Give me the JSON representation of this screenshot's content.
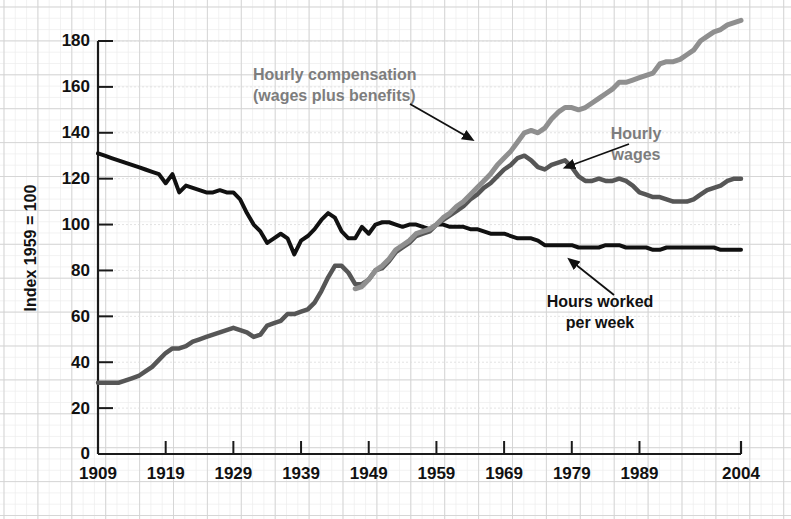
{
  "chart_data": {
    "type": "line",
    "title": "",
    "subtitle": "",
    "xlabel": "",
    "ylabel": "Index 1959 = 100",
    "xlim": [
      1909,
      2004
    ],
    "ylim": [
      0,
      190
    ],
    "grid": true,
    "grid_style": "graph-paper",
    "legend_position": "inline-annotations",
    "yticks": [
      0,
      20,
      40,
      60,
      80,
      100,
      120,
      140,
      160,
      180
    ],
    "ytick_labels": [
      "0",
      "20",
      "40",
      "60",
      "80",
      "100",
      "120",
      "140",
      "160",
      "180"
    ],
    "xticks": [
      1909,
      1919,
      1929,
      1939,
      1949,
      1959,
      1969,
      1979,
      1989,
      2004
    ],
    "xtick_labels": [
      "1909",
      "1919",
      "1929",
      "1939",
      "1949",
      "1959",
      "1969",
      "1979",
      "1989",
      "2004"
    ],
    "series": [
      {
        "name": "Hours worked per week",
        "color": "#111111",
        "width": 4.0,
        "x": [
          1909,
          1910,
          1911,
          1912,
          1913,
          1914,
          1915,
          1916,
          1917,
          1918,
          1919,
          1920,
          1921,
          1922,
          1923,
          1924,
          1925,
          1926,
          1927,
          1928,
          1929,
          1930,
          1931,
          1932,
          1933,
          1934,
          1935,
          1936,
          1937,
          1938,
          1939,
          1940,
          1941,
          1942,
          1943,
          1944,
          1945,
          1946,
          1947,
          1948,
          1949,
          1950,
          1951,
          1952,
          1953,
          1954,
          1955,
          1956,
          1957,
          1958,
          1959,
          1960,
          1961,
          1962,
          1963,
          1964,
          1965,
          1966,
          1967,
          1968,
          1969,
          1970,
          1971,
          1972,
          1973,
          1974,
          1975,
          1976,
          1977,
          1978,
          1979,
          1980,
          1981,
          1982,
          1983,
          1984,
          1985,
          1986,
          1987,
          1988,
          1989,
          1990,
          1991,
          1992,
          1993,
          1994,
          1995,
          1996,
          1997,
          1998,
          1999,
          2000,
          2001,
          2002,
          2003,
          2004
        ],
        "values": [
          131,
          130,
          129,
          128,
          127,
          126,
          125,
          124,
          123,
          122,
          118,
          122,
          114,
          117,
          116,
          115,
          114,
          114,
          115,
          114,
          114,
          111,
          105,
          100,
          97,
          92,
          94,
          96,
          94,
          87,
          93,
          95,
          98,
          102,
          105,
          103,
          97,
          94,
          94,
          99,
          96,
          100,
          101,
          101,
          100,
          99,
          100,
          100,
          99,
          98,
          100,
          100,
          99,
          99,
          99,
          98,
          98,
          97,
          96,
          96,
          96,
          95,
          94,
          94,
          94,
          93,
          91,
          91,
          91,
          91,
          91,
          90,
          90,
          90,
          90,
          91,
          91,
          91,
          90,
          90,
          90,
          90,
          89,
          89,
          90,
          90,
          90,
          90,
          90,
          90,
          90,
          90,
          89,
          89,
          89,
          89
        ]
      },
      {
        "name": "Hourly wages",
        "color": "#565656",
        "width": 4.5,
        "x": [
          1909,
          1910,
          1911,
          1912,
          1913,
          1914,
          1915,
          1916,
          1917,
          1918,
          1919,
          1920,
          1921,
          1922,
          1923,
          1924,
          1925,
          1926,
          1927,
          1928,
          1929,
          1930,
          1931,
          1932,
          1933,
          1934,
          1935,
          1936,
          1937,
          1938,
          1939,
          1940,
          1941,
          1942,
          1943,
          1944,
          1945,
          1946,
          1947,
          1948,
          1949,
          1950,
          1951,
          1952,
          1953,
          1954,
          1955,
          1956,
          1957,
          1958,
          1959,
          1960,
          1961,
          1962,
          1963,
          1964,
          1965,
          1966,
          1967,
          1968,
          1969,
          1970,
          1971,
          1972,
          1973,
          1974,
          1975,
          1976,
          1977,
          1978,
          1979,
          1980,
          1981,
          1982,
          1983,
          1984,
          1985,
          1986,
          1987,
          1988,
          1989,
          1990,
          1991,
          1992,
          1993,
          1994,
          1995,
          1996,
          1997,
          1998,
          1999,
          2000,
          2001,
          2002,
          2003,
          2004
        ],
        "values": [
          31,
          31,
          31,
          31,
          32,
          33,
          34,
          36,
          38,
          41,
          44,
          46,
          46,
          47,
          49,
          50,
          51,
          52,
          53,
          54,
          55,
          54,
          53,
          51,
          52,
          56,
          57,
          58,
          61,
          61,
          62,
          63,
          66,
          71,
          77,
          82,
          82,
          79,
          74,
          74,
          76,
          80,
          81,
          84,
          88,
          90,
          92,
          95,
          96,
          97,
          100,
          102,
          104,
          106,
          108,
          111,
          113,
          116,
          118,
          121,
          124,
          126,
          129,
          130,
          128,
          125,
          124,
          126,
          127,
          128,
          125,
          121,
          119,
          119,
          120,
          119,
          119,
          120,
          119,
          117,
          114,
          113,
          112,
          112,
          111,
          110,
          110,
          110,
          111,
          113,
          115,
          116,
          117,
          119,
          120,
          120
        ]
      },
      {
        "name": "Hourly compensation (wages plus benefits)",
        "color": "#8f8f8f",
        "width": 5.0,
        "x": [
          1947,
          1948,
          1949,
          1950,
          1951,
          1952,
          1953,
          1954,
          1955,
          1956,
          1957,
          1958,
          1959,
          1960,
          1961,
          1962,
          1963,
          1964,
          1965,
          1966,
          1967,
          1968,
          1969,
          1970,
          1971,
          1972,
          1973,
          1974,
          1975,
          1976,
          1977,
          1978,
          1979,
          1980,
          1981,
          1982,
          1983,
          1984,
          1985,
          1986,
          1987,
          1988,
          1989,
          1990,
          1991,
          1992,
          1993,
          1994,
          1995,
          1996,
          1997,
          1998,
          1999,
          2000,
          2001,
          2002,
          2003,
          2004
        ],
        "values": [
          72,
          73,
          76,
          80,
          82,
          85,
          89,
          91,
          93,
          96,
          97,
          98,
          100,
          103,
          105,
          108,
          110,
          113,
          116,
          119,
          122,
          126,
          129,
          132,
          136,
          140,
          141,
          140,
          142,
          146,
          149,
          151,
          151,
          150,
          151,
          153,
          155,
          157,
          159,
          162,
          162,
          163,
          164,
          165,
          166,
          170,
          171,
          171,
          172,
          174,
          176,
          180,
          182,
          184,
          185,
          187,
          188,
          189
        ]
      }
    ],
    "annotations": [
      {
        "id": "ann-compensation",
        "lines": [
          "Hourly compensation",
          "(wages plus benefits)"
        ],
        "color": "#7d7d7d",
        "text_x": 253,
        "text_y": 80,
        "arrow": {
          "x1": 410,
          "y1": 104,
          "x2": 466,
          "y2": 136
        }
      },
      {
        "id": "ann-wages",
        "lines": [
          "Hourly",
          "wages"
        ],
        "color": "#7d7d7d",
        "text_x": 636,
        "text_y": 139,
        "arrow": {
          "x1": 629,
          "y1": 144,
          "x2": 572,
          "y2": 165
        }
      },
      {
        "id": "ann-hours",
        "lines": [
          "Hours worked",
          "per week"
        ],
        "color": "#111111",
        "text_x": 600,
        "text_y": 307,
        "arrow": {
          "x1": 614,
          "y1": 295,
          "x2": 575,
          "y2": 264
        }
      }
    ]
  },
  "axes": {
    "y_title": "Index 1959 = 100"
  }
}
